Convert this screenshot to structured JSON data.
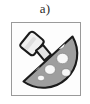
{
  "figure": {
    "label": "a)",
    "frame": {
      "border_color": "#9a9a9a",
      "background_color": "#fdfdfd",
      "x": 11,
      "y": 22,
      "width": 70,
      "height": 74
    },
    "colors": {
      "label_text": "#2b2b2b",
      "outline": "#1a1a1a",
      "cap_fill": "#9e9e9e",
      "cap_shadow": "#7d7d7d",
      "spot_fill": "#f7f7f7",
      "stem_fill": "#f0f0f0",
      "stem_shadow": "#d4d4d4",
      "ring_fill": "#e2e2e2",
      "page_background": "#ffffff"
    },
    "parts": {
      "cap_name": "mushroom-cap",
      "stem_name": "mushroom-stem",
      "ring_name": "mushroom-ring",
      "spots_name": "mushroom-cap-spots"
    },
    "spots": [
      {
        "cx": 47.5,
        "cy": 21.5,
        "rx": 5.2,
        "ry": 4.6
      },
      {
        "cx": 34.0,
        "cy": 30.0,
        "rx": 5.6,
        "ry": 5.0
      },
      {
        "cx": 50.5,
        "cy": 35.5,
        "rx": 5.8,
        "ry": 5.2
      },
      {
        "cx": 22.5,
        "cy": 43.0,
        "rx": 5.0,
        "ry": 4.4
      },
      {
        "cx": 38.0,
        "cy": 46.5,
        "rx": 5.4,
        "ry": 4.8
      },
      {
        "cx": 54.0,
        "cy": 49.5,
        "rx": 4.4,
        "ry": 3.8
      },
      {
        "cx": 29.0,
        "cy": 55.0,
        "rx": 3.6,
        "ry": 2.8
      }
    ]
  }
}
